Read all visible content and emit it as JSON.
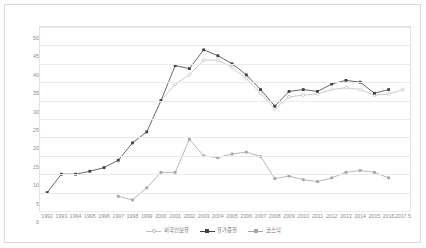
{
  "chart_data": {
    "type": "line",
    "title": "",
    "xlabel": "",
    "ylabel": "",
    "ylim": [
      0,
      50
    ],
    "ytick_step": 5,
    "grid": true,
    "legend_position": "bottom",
    "yticks": [
      "0",
      "5",
      "10",
      "15",
      "20",
      "25",
      "30",
      "35",
      "40",
      "45",
      "50"
    ],
    "categories": [
      "1992",
      "1993",
      "1994",
      "1995",
      "1996",
      "1997",
      "1998",
      "1999",
      "2000",
      "2001",
      "2002",
      "2003",
      "2004",
      "2005",
      "2006",
      "2007",
      "2008",
      "2009",
      "2010",
      "2011",
      "2012",
      "2013",
      "2014",
      "2015",
      "2016",
      "2017.5"
    ],
    "series": [
      {
        "name": "외국인보유",
        "color": "#bfbfbf",
        "marker": "open-circle",
        "values": [
          null,
          null,
          null,
          null,
          null,
          null,
          null,
          null,
          30.0,
          34.5,
          37.0,
          41.0,
          41.0,
          39.0,
          36.0,
          32.0,
          27.8,
          31.0,
          31.5,
          31.8,
          33.0,
          33.5,
          33.0,
          31.5,
          31.8,
          33.0
        ]
      },
      {
        "name": "유가증권",
        "color": "#404040",
        "marker": "filled-square",
        "values": [
          5.0,
          10.0,
          10.0,
          10.8,
          11.8,
          13.8,
          18.5,
          21.5,
          30.0,
          39.5,
          38.7,
          43.8,
          42.2,
          40.0,
          37.0,
          33.0,
          28.5,
          32.5,
          33.0,
          32.5,
          34.5,
          35.5,
          35.0,
          32.0,
          33.0,
          null
        ]
      },
      {
        "name": "코스닥",
        "color": "#a6a6a6",
        "marker": "filled-square",
        "values": [
          null,
          null,
          null,
          null,
          null,
          4.0,
          3.0,
          6.3,
          10.5,
          10.5,
          19.5,
          15.0,
          14.5,
          15.5,
          16.0,
          14.8,
          8.8,
          9.5,
          8.5,
          8.0,
          9.0,
          10.5,
          11.0,
          10.5,
          9.0,
          null
        ]
      }
    ]
  },
  "legend": {
    "items": [
      {
        "label": "외국인보유"
      },
      {
        "label": "유가증권"
      },
      {
        "label": "코스닥"
      }
    ]
  },
  "colors": {
    "frame_border": "#d9d9d9",
    "plot_border": "#e3e3e3",
    "gridline": "#eaeaea",
    "tick_text": "#8c8c8c",
    "legend_text": "#6e6e6e"
  }
}
